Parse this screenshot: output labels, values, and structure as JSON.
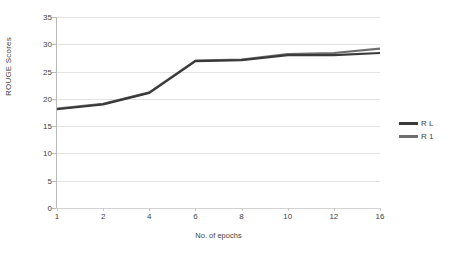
{
  "chart_data": {
    "type": "line",
    "title": "",
    "xlabel": "No. of epochs",
    "ylabel": "ROUGE Scores",
    "categories": [
      "1",
      "2",
      "4",
      "6",
      "8",
      "10",
      "12",
      "16"
    ],
    "x": [
      1,
      2,
      4,
      6,
      8,
      10,
      12,
      16
    ],
    "ylim": [
      0,
      35
    ],
    "yticks": [
      "0",
      "5",
      "10",
      "15",
      "20",
      "25",
      "30",
      "35"
    ],
    "ytick_values": [
      0,
      5,
      10,
      15,
      20,
      25,
      30,
      35
    ],
    "grid": "horizontal",
    "legend_position": "right",
    "series": [
      {
        "name": "R L",
        "color": "#3a3a3a",
        "values": [
          18.1,
          19.0,
          21.1,
          26.9,
          27.1,
          28.0,
          28.0,
          28.4
        ]
      },
      {
        "name": "R 1",
        "color": "#6e6e6e",
        "values": [
          18.2,
          19.1,
          21.2,
          27.0,
          27.2,
          28.2,
          28.4,
          29.2
        ]
      }
    ]
  },
  "legend": {
    "items": [
      {
        "label": "R L",
        "color": "#3a3a3a"
      },
      {
        "label": "R 1",
        "color": "#6e6e6e"
      }
    ]
  },
  "axes": {
    "y_title": "ROUGE Scores",
    "x_title": "No. of epochs"
  },
  "colors": {
    "gridline": "#e4e4e4",
    "axis": "#b9b9b9",
    "text": "#3f3f3f",
    "background": "#ffffff"
  }
}
